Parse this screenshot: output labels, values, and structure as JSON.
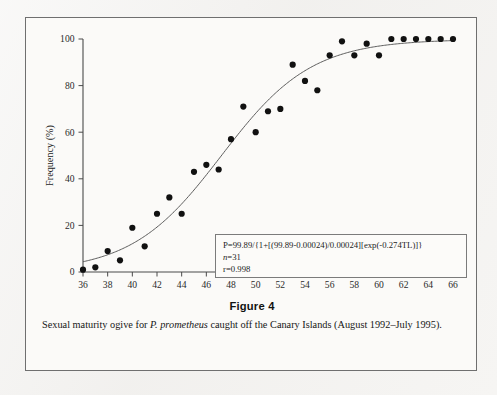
{
  "figure": {
    "number_label": "Figure 4",
    "caption_part1": "Sexual maturity ogive for ",
    "caption_species": "P. prometheus",
    "caption_part2": " caught off the Canary Islands (August 1992–July 1995)."
  },
  "equation_box": {
    "equation": "P=99.89/{1+[(99.89-0.00024)/0.00024][exp(-0.274TL)]}",
    "n_symbol": "n",
    "n_value": "=31",
    "r_value": "r=0.998"
  },
  "colors": {
    "point_fill": "#111111",
    "curve_stroke": "#5c5c5c",
    "axis_stroke": "#4a4a4a",
    "frame_border": "#6f6f6f",
    "page_background": "#f2f1ef",
    "figure_background": "#fbfaf8"
  },
  "chart_data": {
    "type": "scatter",
    "title": "",
    "xlabel": "Total length (cm)",
    "ylabel": "Frequency (%)",
    "xlim": [
      36,
      66
    ],
    "ylim": [
      0,
      100
    ],
    "xticks": [
      36,
      38,
      40,
      42,
      44,
      46,
      48,
      50,
      52,
      54,
      56,
      58,
      60,
      62,
      64,
      66
    ],
    "yticks": [
      0,
      20,
      40,
      60,
      80,
      100
    ],
    "xtick_labels": [
      "36",
      "38",
      "40",
      "42",
      "44",
      "46",
      "48",
      "50",
      "52",
      "54",
      "56",
      "58",
      "60",
      "62",
      "64",
      "66"
    ],
    "ytick_labels": [
      "0",
      "20",
      "40",
      "60",
      "80",
      "100"
    ],
    "grid": false,
    "legend": "none",
    "x": [
      36,
      37,
      38,
      39,
      40,
      41,
      42,
      43,
      44,
      45,
      46,
      47,
      48,
      49,
      50,
      51,
      52,
      53,
      54,
      55,
      56,
      57,
      58,
      59,
      60,
      61,
      62,
      63,
      64,
      65,
      66
    ],
    "values": [
      1,
      2,
      9,
      5,
      19,
      11,
      25,
      32,
      25,
      43,
      46,
      44,
      57,
      71,
      60,
      69,
      70,
      89,
      82,
      78,
      93,
      99,
      93,
      98,
      93,
      100,
      100,
      100,
      100,
      100,
      100
    ],
    "series": [
      {
        "name": "Observed maturity frequency",
        "marker": "filled-circle",
        "values": [
          1,
          2,
          9,
          5,
          19,
          11,
          25,
          32,
          25,
          43,
          46,
          44,
          57,
          71,
          60,
          69,
          70,
          89,
          82,
          78,
          93,
          99,
          93,
          98,
          93,
          100,
          100,
          100,
          100,
          100,
          100
        ]
      }
    ],
    "fitted_curve": {
      "name": "Logistic ogive fit",
      "model": "P=99.89/{1+[(99.89-0.00024)/0.00024][exp(-0.274TL)]}",
      "asymptote": 99.89,
      "rate": 0.274,
      "p0": 0.00024,
      "n": 31,
      "r": 0.998
    },
    "annotations": [
      "P=99.89/{1+[(99.89-0.00024)/0.00024][exp(-0.274TL)]}",
      "n=31",
      "r=0.998"
    ]
  }
}
